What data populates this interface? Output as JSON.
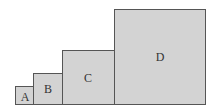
{
  "diagram": {
    "type": "ascending-squares",
    "fill_color": "#d3d3d3",
    "border_color": "#555555",
    "squares": [
      {
        "label": "A",
        "x": 15,
        "y": 86,
        "size": 19
      },
      {
        "label": "B",
        "x": 33,
        "y": 73,
        "size": 32
      },
      {
        "label": "C",
        "x": 62,
        "y": 50,
        "size": 55
      },
      {
        "label": "D",
        "x": 114,
        "y": 9,
        "size": 96
      }
    ]
  }
}
